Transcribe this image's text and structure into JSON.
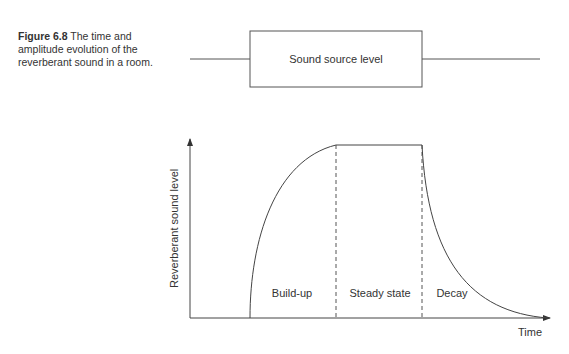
{
  "caption": {
    "figure_number": "Figure 6.8",
    "text": "The time and amplitude evolution of the reverberant sound in a room."
  },
  "source_box": {
    "label": "Sound source level"
  },
  "graph": {
    "y_axis_label": "Reverberant sound level",
    "x_axis_label": "Time",
    "phases": [
      {
        "label": "Build-up"
      },
      {
        "label": "Steady state"
      },
      {
        "label": "Decay"
      }
    ]
  },
  "colors": {
    "line": "#444444",
    "text": "#333333",
    "background": "#ffffff"
  }
}
